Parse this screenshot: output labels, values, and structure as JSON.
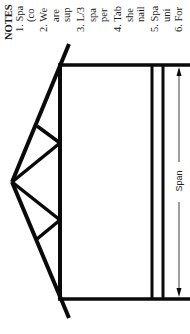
{
  "diagram": {
    "type": "roof truss elevation (rotated 90°)",
    "dimension_label": "Span",
    "colors": {
      "line": "#0a0a0a",
      "background": "#ffffff",
      "text": "#1a1a1a"
    }
  },
  "notes": {
    "lines": [
      {
        "text": "NOTES",
        "x": 3,
        "heading": true
      },
      {
        "text": "1. Spa",
        "x": 14
      },
      {
        "text": "(co",
        "x": 25
      },
      {
        "text": "2. We",
        "x": 38
      },
      {
        "text": "are",
        "x": 50
      },
      {
        "text": "sup",
        "x": 61
      },
      {
        "text": "3. L/3",
        "x": 75
      },
      {
        "text": "spa",
        "x": 87
      },
      {
        "text": "per",
        "x": 98
      },
      {
        "text": "4. Tab",
        "x": 112
      },
      {
        "text": "she",
        "x": 124
      },
      {
        "text": "nail",
        "x": 135
      },
      {
        "text": "5. Spa",
        "x": 149
      },
      {
        "text": "uni",
        "x": 161
      },
      {
        "text": "6. For",
        "x": 173
      }
    ]
  }
}
